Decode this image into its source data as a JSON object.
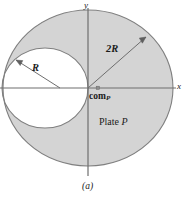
{
  "figure": {
    "caption": "(a)",
    "geometry": {
      "origin_x": 88,
      "origin_y": 88,
      "big_circle_rx": 85,
      "big_circle_ry": 78,
      "hole_center_x": 45,
      "hole_center_y": 88,
      "hole_rx": 43,
      "hole_ry": 40,
      "fill_color": "#d4d4d4",
      "stroke_color": "#7a7a7a",
      "axis_color": "#6e6e6e",
      "text_color": "#1b1b1b"
    },
    "labels": {
      "axis_y": "y",
      "axis_x": "x",
      "big_radius": "2R",
      "hole_radius": "R",
      "com_text": "com",
      "com_subscript": "P",
      "plate_text": "Plate ",
      "plate_symbol": "P"
    }
  }
}
